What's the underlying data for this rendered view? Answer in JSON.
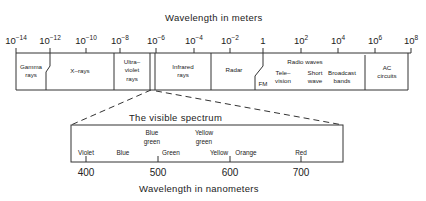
{
  "top_axis": {
    "title": "Wavelength in meters",
    "ticks": [
      {
        "base": "10",
        "exp": "−14",
        "x": 16
      },
      {
        "base": "10",
        "exp": "−12",
        "x": 50
      },
      {
        "base": "10",
        "exp": "−10",
        "x": 86
      },
      {
        "base": "10",
        "exp": "−8",
        "x": 120
      },
      {
        "base": "10",
        "exp": "−6",
        "x": 156
      },
      {
        "base": "10",
        "exp": "−4",
        "x": 194
      },
      {
        "base": "10",
        "exp": "−2",
        "x": 230
      },
      {
        "base": "1",
        "exp": "",
        "x": 263
      },
      {
        "base": "10",
        "exp": "2",
        "x": 301
      },
      {
        "base": "10",
        "exp": "4",
        "x": 338
      },
      {
        "base": "10",
        "exp": "6",
        "x": 375
      },
      {
        "base": "10",
        "exp": "8",
        "x": 411
      }
    ]
  },
  "bands": {
    "gamma": "Gamma\nrays",
    "xrays": "X–rays",
    "ultraviolet": "Ultra–\nviolet\nrays",
    "infrared": "Infrared\nrays",
    "radar": "Radar",
    "radio_waves": "Radio waves",
    "fm": "FM",
    "television": "Tele–\nvision",
    "short_wave": "Short\nwave",
    "broadcast": "Broadcast\nbands",
    "ac": "AC\ncircuits"
  },
  "visible": {
    "title": "The visible spectrum",
    "colors": {
      "violet": "Violet",
      "blue": "Blue",
      "blue_green": "Blue\ngreen",
      "green": "Green",
      "yellow_green": "Yellow\ngreen",
      "yellow": "Yellow",
      "orange": "Orange",
      "red": "Red"
    },
    "ticks": [
      "400",
      "500",
      "600",
      "700"
    ],
    "axis_label": "Wavelength in nanometers"
  }
}
